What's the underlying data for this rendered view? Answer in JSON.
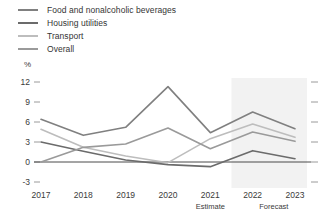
{
  "legend": {
    "items": [
      {
        "label": "Food and nonalcoholic beverages",
        "color": "#808080"
      },
      {
        "label": "Housing utilities",
        "color": "#6b6b6b"
      },
      {
        "label": "Transport",
        "color": "#bdbdbd"
      },
      {
        "label": "Overall",
        "color": "#9a9a9a"
      }
    ]
  },
  "axis": {
    "unit": "%",
    "y_ticks": [
      "12",
      "9",
      "6",
      "3",
      "0",
      "-3"
    ],
    "x_ticks": [
      "2017",
      "2018",
      "2019",
      "2020",
      "2021",
      "2022",
      "2023"
    ],
    "notes": [
      {
        "label": "Estimate",
        "under": "2021"
      },
      {
        "label": "Forecast",
        "under": "2022-2023"
      }
    ]
  },
  "colors": {
    "axis_line": "#4a4a4a",
    "tick_mark": "#9a9a9a",
    "forecast_band": "#f2f2f2",
    "background": "#ffffff"
  },
  "chart_data": {
    "type": "line",
    "title": "",
    "xlabel": "",
    "ylabel": "%",
    "categories": [
      "2017",
      "2018",
      "2019",
      "2020",
      "2021",
      "2022",
      "2023"
    ],
    "ylim": [
      -3,
      12
    ],
    "ytick_values": [
      12,
      9,
      6,
      3,
      0,
      -3
    ],
    "grid": false,
    "legend_position": "top-left",
    "annotations": [
      "Estimate",
      "Forecast"
    ],
    "forecast_start": "2021.5",
    "series": [
      {
        "name": "Food and nonalcoholic beverages",
        "color": "#808080",
        "values": [
          6.4,
          4.0,
          5.2,
          11.3,
          4.4,
          7.5,
          5.0
        ]
      },
      {
        "name": "Housing utilities",
        "color": "#6b6b6b",
        "values": [
          3.0,
          1.6,
          0.3,
          -0.4,
          -0.7,
          1.7,
          0.5
        ]
      },
      {
        "name": "Transport",
        "color": "#bdbdbd",
        "values": [
          4.9,
          2.2,
          0.9,
          -0.1,
          3.5,
          5.7,
          3.7
        ]
      },
      {
        "name": "Overall",
        "color": "#9a9a9a",
        "values": [
          0.0,
          2.2,
          2.7,
          5.1,
          2.0,
          4.5,
          3.1
        ]
      }
    ]
  }
}
